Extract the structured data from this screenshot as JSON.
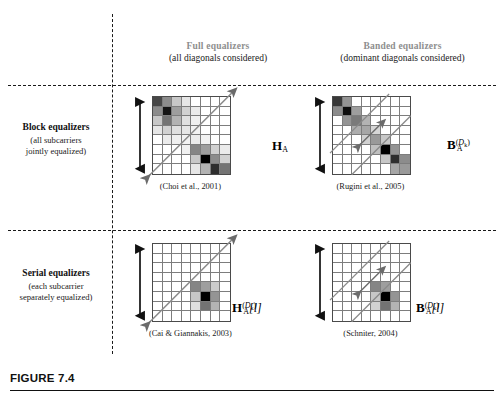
{
  "figure": {
    "caption_label": "FIGURE 7.4",
    "accent_header_color": "#8e8e8e",
    "ink_color": "#1a1a1a"
  },
  "columns": [
    {
      "id": "full",
      "title": "Full equalizers",
      "subtitle": "(all diagonals considered)"
    },
    {
      "id": "banded",
      "title": "Banded equalizers",
      "subtitle": "(dominant diagonals considered)"
    }
  ],
  "rows": [
    {
      "id": "block",
      "title": "Block equalizers",
      "subtitle_line1": "(all subcarriers",
      "subtitle_line2": "jointly equalized)"
    },
    {
      "id": "serial",
      "title": "Serial equalizers",
      "subtitle_line1": "(each subcarrier",
      "subtitle_line2": "separately equalized)"
    }
  ],
  "cells": [
    {
      "id": "block-full",
      "row": "block",
      "column": "full",
      "citation": "(Choi et al., 2001)",
      "label_base": "H",
      "label_sub": "A",
      "label_sup": "",
      "label_index": "",
      "label_plain": "H_A",
      "matrix_size": 8,
      "arrow_style": "full-diagonal-double",
      "band_lines": 0,
      "shades": [
        [
          0.72,
          0.45,
          0.22,
          0.1,
          0.0,
          0.0,
          0.0,
          0.0
        ],
        [
          0.45,
          0.92,
          0.38,
          0.18,
          0.08,
          0.0,
          0.0,
          0.0
        ],
        [
          0.22,
          0.55,
          0.3,
          0.12,
          0.06,
          0.0,
          0.0,
          0.0
        ],
        [
          0.1,
          0.18,
          0.12,
          0.1,
          0.05,
          0.0,
          0.0,
          0.0
        ],
        [
          0.0,
          0.08,
          0.06,
          0.05,
          0.08,
          0.05,
          0.0,
          0.0
        ],
        [
          0.0,
          0.0,
          0.0,
          0.06,
          0.48,
          0.38,
          0.18,
          0.08
        ],
        [
          0.0,
          0.0,
          0.0,
          0.0,
          0.22,
          1.0,
          0.45,
          0.18
        ],
        [
          0.0,
          0.0,
          0.0,
          0.0,
          0.1,
          0.3,
          0.82,
          0.55
        ]
      ]
    },
    {
      "id": "block-banded",
      "row": "block",
      "column": "banded",
      "citation": "(Rugini et al., 2005)",
      "label_base": "B",
      "label_sub": "A",
      "label_sup": "(D_k)",
      "label_index": "",
      "label_plain": "B_A^(D_k)",
      "matrix_size": 8,
      "arrow_style": "band-width-double",
      "band_lines": 2,
      "shades": [
        [
          0.78,
          0.42,
          0.0,
          0.0,
          0.0,
          0.0,
          0.0,
          0.0
        ],
        [
          0.45,
          0.95,
          0.38,
          0.0,
          0.0,
          0.0,
          0.0,
          0.0
        ],
        [
          0.0,
          0.42,
          0.52,
          0.3,
          0.0,
          0.0,
          0.0,
          0.0
        ],
        [
          0.0,
          0.0,
          0.32,
          0.35,
          0.16,
          0.0,
          0.0,
          0.0
        ],
        [
          0.0,
          0.0,
          0.0,
          0.18,
          0.4,
          0.22,
          0.0,
          0.0
        ],
        [
          0.0,
          0.0,
          0.0,
          0.0,
          0.25,
          1.0,
          0.42,
          0.0
        ],
        [
          0.0,
          0.0,
          0.0,
          0.0,
          0.0,
          0.22,
          0.82,
          0.45
        ],
        [
          0.0,
          0.0,
          0.0,
          0.0,
          0.0,
          0.0,
          0.35,
          0.4
        ]
      ]
    },
    {
      "id": "serial-full",
      "row": "serial",
      "column": "full",
      "citation": "(Cai & Giannakis, 2003)",
      "label_base": "H",
      "label_sub": "A",
      "label_sup": "(D_k)",
      "label_index": "[l]",
      "label_plain": "H_A^(D_k)[l]",
      "matrix_size": 8,
      "arrow_style": "full-diagonal-double",
      "band_lines": 0,
      "shades": [
        [
          0.0,
          0.0,
          0.0,
          0.0,
          0.0,
          0.0,
          0.0,
          0.0
        ],
        [
          0.0,
          0.0,
          0.0,
          0.0,
          0.0,
          0.0,
          0.0,
          0.0
        ],
        [
          0.0,
          0.0,
          0.0,
          0.0,
          0.0,
          0.0,
          0.0,
          0.0
        ],
        [
          0.0,
          0.0,
          0.0,
          0.0,
          0.0,
          0.0,
          0.0,
          0.0
        ],
        [
          0.0,
          0.0,
          0.0,
          0.0,
          0.48,
          0.38,
          0.2,
          0.0
        ],
        [
          0.0,
          0.0,
          0.0,
          0.0,
          0.22,
          1.0,
          0.42,
          0.0
        ],
        [
          0.0,
          0.0,
          0.0,
          0.0,
          0.12,
          0.55,
          0.3,
          0.0
        ],
        [
          0.0,
          0.0,
          0.0,
          0.0,
          0.0,
          0.0,
          0.0,
          0.0
        ]
      ]
    },
    {
      "id": "serial-banded",
      "row": "serial",
      "column": "banded",
      "citation": "(Schniter, 2004)",
      "label_base": "B",
      "label_sub": "A",
      "label_sup": "(D_k)",
      "label_index": "[l]",
      "label_plain": "B_A^(D_k)[l]",
      "matrix_size": 8,
      "arrow_style": "band-width-double",
      "band_lines": 2,
      "shades": [
        [
          0.0,
          0.0,
          0.0,
          0.0,
          0.0,
          0.0,
          0.0,
          0.0
        ],
        [
          0.0,
          0.0,
          0.0,
          0.0,
          0.0,
          0.0,
          0.0,
          0.0
        ],
        [
          0.0,
          0.0,
          0.0,
          0.0,
          0.0,
          0.0,
          0.0,
          0.0
        ],
        [
          0.0,
          0.0,
          0.0,
          0.0,
          0.0,
          0.0,
          0.0,
          0.0
        ],
        [
          0.0,
          0.0,
          0.0,
          0.0,
          0.48,
          0.38,
          0.0,
          0.0
        ],
        [
          0.0,
          0.0,
          0.0,
          0.0,
          0.22,
          1.0,
          0.42,
          0.0
        ],
        [
          0.0,
          0.0,
          0.0,
          0.0,
          0.18,
          0.55,
          0.3,
          0.0
        ],
        [
          0.0,
          0.0,
          0.0,
          0.0,
          0.0,
          0.0,
          0.0,
          0.0
        ]
      ]
    }
  ]
}
